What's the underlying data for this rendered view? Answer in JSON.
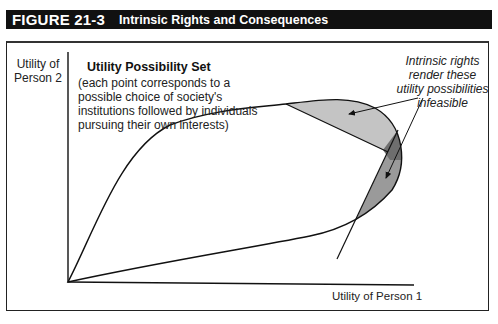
{
  "figure": {
    "number": "FIGURE 21-3",
    "title": "Intrinsic Rights and Consequences"
  },
  "axes": {
    "y_label_line1": "Utility of",
    "y_label_line2": "Person 2",
    "x_label": "Utility of Person 1"
  },
  "set": {
    "title": "Utility Possibility Set",
    "description": "(each point corresponds to a possible choice of society's institutions followed by individuals pursuing their own interests)"
  },
  "annotation": {
    "text": "Intrinsic rights render these utility possibilities infeasible"
  },
  "colors": {
    "title_bar": "#111111",
    "region_light": "#c4c4c4",
    "region_mid": "#9a9a9a",
    "region_overlap": "#6e6e6e",
    "line": "#111111"
  }
}
